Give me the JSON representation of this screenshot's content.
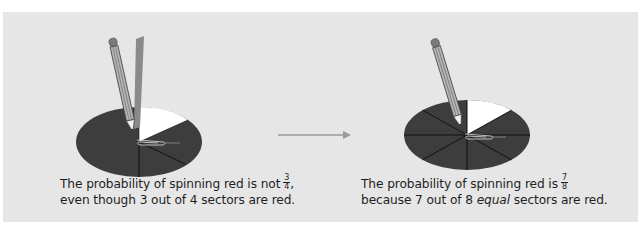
{
  "figure": {
    "background_color": "#e6e6e6",
    "sector_color": "#3d3d3d",
    "highlight_sector_color": "#ffffff",
    "arrow_color": "#9a9a9a"
  },
  "left_spinner": {
    "sectors_total": 4,
    "sectors_red": 3,
    "equal_sectors": false,
    "caption": {
      "line1_prefix": "The probability of spinning red is not",
      "fraction_numerator": "3",
      "fraction_denominator": "4",
      "line1_suffix": ",",
      "line2": "even though 3 out of 4 sectors are red."
    }
  },
  "arrow": {
    "icon": "arrow-right-icon"
  },
  "right_spinner": {
    "sectors_total": 8,
    "sectors_red": 7,
    "equal_sectors": true,
    "caption": {
      "line1_prefix": "The probability of spinning red is",
      "fraction_numerator": "7",
      "fraction_denominator": "8",
      "line2_prefix": "because 7 out of 8",
      "line2_italic": "equal",
      "line2_suffix": "sectors are red."
    }
  }
}
